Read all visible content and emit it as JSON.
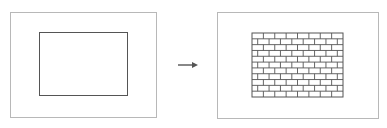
{
  "diagram": {
    "left_panel": {
      "label": "",
      "content": "empty-rectangle"
    },
    "arrow": {
      "direction": "right"
    },
    "right_panel": {
      "label": "",
      "content": "brick-pattern-rectangle",
      "brick_rows": 11,
      "bricks_per_row": 8
    },
    "colors": {
      "frame": "#b8b8b8",
      "shape_stroke": "#555555",
      "arrow": "#555555",
      "background": "#ffffff"
    }
  }
}
